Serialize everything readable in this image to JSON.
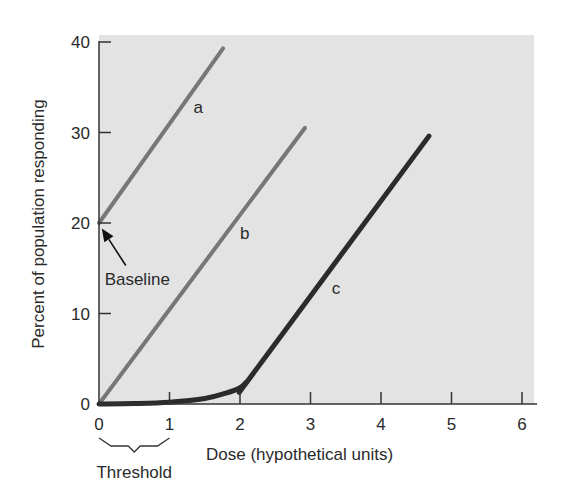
{
  "chart_data": {
    "type": "line",
    "title": "",
    "xlabel": "Dose (hypothetical units)",
    "ylabel": "Percent of population responding",
    "xlim": [
      0,
      6.2
    ],
    "ylim": [
      0,
      40
    ],
    "xticks": [
      0,
      1,
      2,
      3,
      4,
      5,
      6
    ],
    "yticks": [
      0,
      10,
      20,
      30,
      40
    ],
    "grid": false,
    "legend": "inline labels",
    "background": "#e3e3e3",
    "series": [
      {
        "name": "a",
        "color": "#777777",
        "width": 4,
        "points": [
          [
            0,
            20
          ],
          [
            1.76,
            39.3
          ]
        ],
        "label_pos": [
          1.34,
          32.2
        ]
      },
      {
        "name": "b",
        "color": "#777777",
        "width": 4,
        "points": [
          [
            0,
            0
          ],
          [
            2.92,
            30.5
          ]
        ],
        "label_pos": [
          2.0,
          18.2
        ]
      },
      {
        "name": "c",
        "color": "#2b2b2b",
        "width": 5,
        "points": [
          [
            0,
            0
          ],
          [
            0.5,
            0.05
          ],
          [
            1.0,
            0.2
          ],
          [
            1.5,
            0.6
          ],
          [
            1.8,
            1.2
          ],
          [
            2.0,
            1.8
          ],
          [
            2.1,
            2.5
          ],
          [
            2.2,
            3.5
          ],
          [
            4.68,
            29.6
          ]
        ],
        "label_pos": [
          3.3,
          12.2
        ]
      }
    ],
    "annotations": [
      {
        "text": "Baseline",
        "type": "arrow",
        "text_pos": [
          0.08,
          13.2
        ],
        "arrow_from": [
          0.38,
          15.3
        ],
        "arrow_to": [
          0.04,
          19.4
        ]
      },
      {
        "text": "Threshold",
        "type": "brace",
        "from_x": 0,
        "to_x": 1
      }
    ]
  }
}
